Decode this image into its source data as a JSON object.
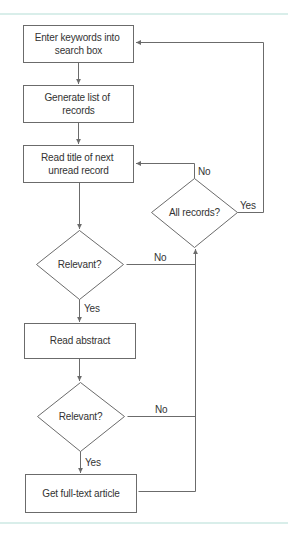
{
  "theme": {
    "stroke": "#6b6b6b",
    "text": "#333333",
    "rule": "#d9eeea"
  },
  "diagram": {
    "nodes": {
      "enter_keywords": {
        "lines": [
          "Enter keywords into",
          "search box"
        ]
      },
      "generate_list": {
        "lines": [
          "Generate list of",
          "records"
        ]
      },
      "read_title": {
        "lines": [
          "Read title of next",
          "unread record"
        ]
      },
      "relevant_1": {
        "label": "Relevant?"
      },
      "read_abstract": {
        "label": "Read abstract"
      },
      "relevant_2": {
        "label": "Relevant?"
      },
      "get_full_text": {
        "label": "Get full-text article"
      },
      "all_records": {
        "label": "All records?"
      }
    },
    "edge_labels": {
      "relevant_1_yes": "Yes",
      "relevant_1_no": "No",
      "relevant_2_yes": "Yes",
      "relevant_2_no": "No",
      "all_records_no": "No",
      "all_records_yes": "Yes"
    }
  }
}
